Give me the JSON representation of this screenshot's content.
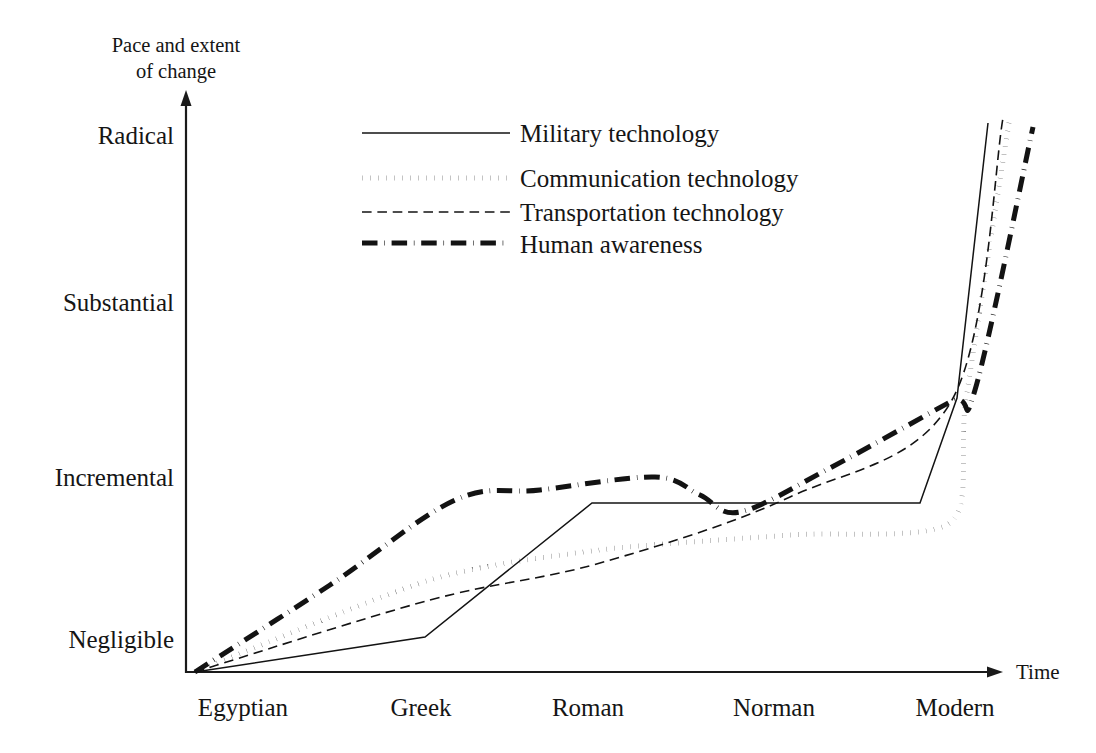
{
  "figure": {
    "background_color": "#ffffff",
    "ink_color": "#131313",
    "axis_title_y_line1": "Pace and extent",
    "axis_title_y_line2": "of change",
    "axis_title_x": "Time"
  },
  "chart_data": {
    "type": "line",
    "title": "",
    "subtitle": "",
    "xlabel": "Time",
    "ylabel": "Pace and extent of change",
    "grid": false,
    "legend_position": "upper-center",
    "categories": [
      "Egyptian",
      "Greek",
      "Roman",
      "Norman",
      "Modern"
    ],
    "x_tick_labels": [
      "Egyptian",
      "Greek",
      "Roman",
      "Norman",
      "Modern"
    ],
    "y_tick_labels": [
      "Negligible",
      "Incremental",
      "Substantial",
      "Radical"
    ],
    "y_tick_values": [
      1,
      2,
      3,
      4
    ],
    "xlim": [
      "Egyptian",
      "beyond Modern"
    ],
    "ylim": [
      "below Negligible",
      "above Radical"
    ],
    "annotations": [],
    "series": [
      {
        "name": "Military technology",
        "line_style": "solid",
        "line_width": 1.5,
        "legend_label": "Military technology",
        "points": [
          {
            "x": "Egyptian",
            "y": "Negligible",
            "px": 195,
            "py": 672
          },
          {
            "x": "pre-Greek",
            "y": "just above Negligible",
            "px": 425,
            "py": 637
          },
          {
            "x": "Roman",
            "y": "just below Incremental",
            "px": 592,
            "py": 503
          },
          {
            "x": "late Norman",
            "y": "just below Incremental",
            "px": 920,
            "py": 503
          },
          {
            "x": "Modern",
            "y": "above Substantial",
            "px": 957,
            "py": 398
          },
          {
            "x": "post-Modern",
            "y": "Radical",
            "px": 988,
            "py": 123
          }
        ]
      },
      {
        "name": "Communication technology",
        "line_style": "dotted",
        "line_width": 5,
        "legend_label": "Communication technology",
        "points": [
          {
            "x": "Egyptian",
            "y": "Negligible",
            "px": 195,
            "py": 672
          },
          {
            "x": "Greek",
            "y": "low",
            "px": 430,
            "py": 580
          },
          {
            "x": "Roman",
            "y": "low-mid",
            "px": 600,
            "py": 550
          },
          {
            "x": "Norman",
            "y": "mid-low",
            "px": 790,
            "py": 535
          },
          {
            "x": "Modern",
            "y": "below Incremental",
            "px": 950,
            "py": 523
          },
          {
            "x": "Modern+",
            "y": "above Substantial",
            "px": 966,
            "py": 400
          },
          {
            "x": "post-Modern",
            "y": "Radical",
            "px": 1010,
            "py": 116
          }
        ]
      },
      {
        "name": "Transportation technology",
        "line_style": "dashed",
        "line_width": 1.6,
        "legend_label": "Transportation technology",
        "points": [
          {
            "x": "Egyptian",
            "y": "Negligible",
            "px": 195,
            "py": 672
          },
          {
            "x": "Greek",
            "y": "low",
            "px": 430,
            "py": 600
          },
          {
            "x": "Roman",
            "y": "low-mid",
            "px": 600,
            "py": 563
          },
          {
            "x": "Norman",
            "y": "mid",
            "px": 790,
            "py": 497
          },
          {
            "x": "Modern",
            "y": "above Substantial",
            "px": 952,
            "py": 400
          },
          {
            "x": "post-Modern",
            "y": "Radical",
            "px": 1003,
            "py": 118
          }
        ]
      },
      {
        "name": "Human awareness",
        "line_style": "dash-dot",
        "line_width": 5,
        "legend_label": "Human awareness",
        "points": [
          {
            "x": "Egyptian",
            "y": "Negligible",
            "px": 195,
            "py": 672
          },
          {
            "x": "pre-Greek",
            "y": "rising",
            "px": 330,
            "py": 585
          },
          {
            "x": "Greek",
            "y": "near Incremental",
            "px": 455,
            "py": 500
          },
          {
            "x": "Greek+",
            "y": "near Incremental",
            "px": 540,
            "py": 490
          },
          {
            "x": "Roman",
            "y": "peak above Incremental",
            "px": 655,
            "py": 477
          },
          {
            "x": "Roman+",
            "y": "declining",
            "px": 700,
            "py": 495
          },
          {
            "x": "Norman",
            "y": "trough below Incremental",
            "px": 740,
            "py": 512
          },
          {
            "x": "Norman+",
            "y": "rising",
            "px": 830,
            "py": 468
          },
          {
            "x": "Modern",
            "y": "above Substantial",
            "px": 950,
            "py": 402
          },
          {
            "x": "Modern+",
            "y": "kink",
            "px": 975,
            "py": 390
          },
          {
            "x": "post-Modern",
            "y": "Radical",
            "px": 1033,
            "py": 127
          }
        ]
      }
    ]
  },
  "axes": {
    "y_axis": {
      "name": "vertical-axis",
      "ticks": [
        {
          "label": "Radical",
          "px_y": 135
        },
        {
          "label": "Substantial",
          "px_y": 302
        },
        {
          "label": "Incremental",
          "px_y": 477
        },
        {
          "label": "Negligible",
          "px_y": 639
        }
      ]
    },
    "x_axis": {
      "name": "horizontal-axis",
      "ticks": [
        {
          "label": "Egyptian",
          "px_x": 243
        },
        {
          "label": "Greek",
          "px_x": 421
        },
        {
          "label": "Roman",
          "px_x": 588
        },
        {
          "label": "Norman",
          "px_x": 774
        },
        {
          "label": "Modern",
          "px_x": 955
        }
      ]
    }
  },
  "legend": {
    "entries": [
      {
        "label": "Military technology",
        "style": "solid"
      },
      {
        "label": "Communication technology",
        "style": "dotted"
      },
      {
        "label": "Transportation technology",
        "style": "dashed"
      },
      {
        "label": "Human awareness",
        "style": "dash-dot"
      }
    ]
  }
}
